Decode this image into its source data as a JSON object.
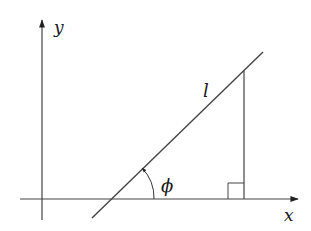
{
  "diagram": {
    "type": "geometry",
    "axes": {
      "x_label": "x",
      "y_label": "y"
    },
    "labels": {
      "length": "l",
      "angle": "ϕ"
    },
    "colors": {
      "stroke": "#333333",
      "background": "#ffffff"
    }
  }
}
